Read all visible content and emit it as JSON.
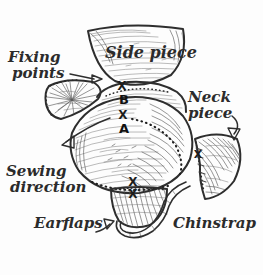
{
  "diagram": {
    "background_color": "#fdfdfd",
    "ink_color": "#2e2e2e",
    "labels": {
      "side_piece": "Side piece",
      "fixing_points": "Fixing points",
      "fixing_points_line1": "Fixing",
      "fixing_points_line2": "points",
      "neck_piece": "Neck piece",
      "neck_piece_line1": "Neck",
      "neck_piece_line2": "piece",
      "sewing_direction": "Sewing direction",
      "sewing_direction_line1": "Sewing",
      "sewing_direction_line2": "direction",
      "earflaps": "Earflaps",
      "chinstrap": "Chinstrap"
    },
    "markers": {
      "point_a": "A",
      "point_b": "B",
      "fixing_cross": "X",
      "cross_top": "X",
      "cross_middle": "X",
      "cross_right": "X",
      "cross_bottom_crown": "X",
      "cross_bottom_earflap": "X"
    },
    "pieces": [
      {
        "name": "side-piece",
        "label": "Side piece"
      },
      {
        "name": "crown-piece",
        "label": ""
      },
      {
        "name": "left-side-piece",
        "label": ""
      },
      {
        "name": "neck-piece",
        "label": "Neck piece"
      },
      {
        "name": "earflap-piece",
        "label": "Earflaps"
      },
      {
        "name": "chinstrap-piece",
        "label": "Chinstrap"
      }
    ],
    "annotations": [
      {
        "name": "fixing-points-arrow",
        "points_to": "X"
      },
      {
        "name": "sewing-direction-arrow",
        "points_to": "crown seam"
      },
      {
        "name": "neck-piece-arrow",
        "points_to": "neck-piece"
      },
      {
        "name": "earflaps-arrow",
        "points_to": "earflap-piece"
      }
    ]
  }
}
